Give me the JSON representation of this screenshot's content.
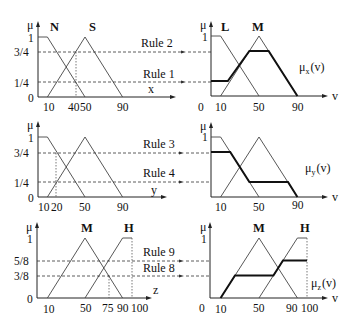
{
  "diagram": {
    "rows": [
      {
        "id": "x",
        "input": {
          "y_axis_label": "μ",
          "x_axis_label": "x",
          "y_ticks": [
            "1",
            "3/4",
            "1/4",
            "0"
          ],
          "y_tick_values": [
            1,
            0.75,
            0.25,
            0
          ],
          "x_ticks": [
            "10",
            "40",
            "50",
            "90"
          ],
          "x_tick_values": [
            10,
            40,
            50,
            90
          ],
          "sets": [
            {
              "name": "N",
              "points": [
                [
                  0,
                  1
                ],
                [
                  10,
                  1
                ],
                [
                  50,
                  0
                ]
              ]
            },
            {
              "name": "S",
              "points": [
                [
                  10,
                  0
                ],
                [
                  50,
                  1
                ],
                [
                  90,
                  0
                ]
              ]
            }
          ],
          "crisp_input": 40,
          "levels": [
            0.75,
            0.25
          ]
        },
        "rules": [
          {
            "label": "Rule 2",
            "level": 0.75
          },
          {
            "label": "Rule 1",
            "level": 0.25
          }
        ],
        "output": {
          "y_axis_label": "μ",
          "x_axis_label": "v",
          "y_ticks": [
            "1"
          ],
          "x_ticks": [
            "0",
            "10",
            "50",
            "90"
          ],
          "x_tick_values": [
            0,
            10,
            50,
            90
          ],
          "sets": [
            {
              "name": "L",
              "points": [
                [
                  0,
                  1
                ],
                [
                  10,
                  1
                ],
                [
                  50,
                  0
                ]
              ]
            },
            {
              "name": "M",
              "points": [
                [
                  10,
                  0
                ],
                [
                  50,
                  1
                ],
                [
                  90,
                  0
                ]
              ]
            }
          ],
          "aggregate_label": "μ x (v)",
          "aggregate_main": "μ",
          "aggregate_sub": "x",
          "aggregate_tail": "(v)",
          "aggregate": [
            [
              0,
              0.25
            ],
            [
              17.5,
              0.25
            ],
            [
              40,
              0.75
            ],
            [
              60,
              0.75
            ],
            [
              90,
              0
            ]
          ]
        }
      },
      {
        "id": "y",
        "input": {
          "y_axis_label": "μ",
          "x_axis_label": "y",
          "y_ticks": [
            "1",
            "3/4",
            "1/4",
            "0"
          ],
          "y_tick_values": [
            1,
            0.75,
            0.25,
            0
          ],
          "x_ticks": [
            "10",
            "20",
            "50",
            "90"
          ],
          "x_tick_values": [
            10,
            20,
            50,
            90
          ],
          "sets": [
            {
              "name": "",
              "points": [
                [
                  0,
                  1
                ],
                [
                  10,
                  1
                ],
                [
                  50,
                  0
                ]
              ]
            },
            {
              "name": "",
              "points": [
                [
                  10,
                  0
                ],
                [
                  50,
                  1
                ],
                [
                  90,
                  0
                ]
              ]
            }
          ],
          "crisp_input": 20,
          "levels": [
            0.75,
            0.25
          ]
        },
        "rules": [
          {
            "label": "Rule 3",
            "level": 0.75
          },
          {
            "label": "Rule 4",
            "level": 0.25
          }
        ],
        "output": {
          "y_axis_label": "μ",
          "x_axis_label": "v",
          "y_ticks": [
            "1"
          ],
          "x_ticks": [
            "10",
            "50",
            "90"
          ],
          "x_tick_values": [
            10,
            50,
            90
          ],
          "sets": [
            {
              "name": "",
              "points": [
                [
                  0,
                  1
                ],
                [
                  10,
                  1
                ],
                [
                  50,
                  0
                ]
              ]
            },
            {
              "name": "",
              "points": [
                [
                  10,
                  0
                ],
                [
                  50,
                  1
                ],
                [
                  90,
                  0
                ]
              ]
            }
          ],
          "aggregate_label": "μ y (v)",
          "aggregate_main": "μ",
          "aggregate_sub": "y",
          "aggregate_tail": "(v)",
          "aggregate": [
            [
              0,
              0.75
            ],
            [
              20,
              0.75
            ],
            [
              40,
              0.25
            ],
            [
              80,
              0.25
            ],
            [
              90,
              0
            ]
          ]
        }
      },
      {
        "id": "z",
        "input": {
          "y_axis_label": "μ",
          "x_axis_label": "z",
          "y_ticks": [
            "1",
            "5/8",
            "3/8",
            "0"
          ],
          "y_tick_values": [
            1,
            0.625,
            0.375,
            0
          ],
          "x_ticks": [
            "10",
            "50",
            "75",
            "90",
            "100"
          ],
          "x_tick_values": [
            10,
            50,
            75,
            90,
            100
          ],
          "sets": [
            {
              "name": "M",
              "points": [
                [
                  10,
                  0
                ],
                [
                  50,
                  1
                ],
                [
                  90,
                  0
                ]
              ]
            },
            {
              "name": "H",
              "points": [
                [
                  50,
                  0
                ],
                [
                  90,
                  1
                ],
                [
                  100,
                  1
                ]
              ]
            }
          ],
          "crisp_input": 75,
          "levels": [
            0.625,
            0.375
          ]
        },
        "rules": [
          {
            "label": "Rule 9",
            "level": 0.625
          },
          {
            "label": "Rule 8",
            "level": 0.375
          }
        ],
        "output": {
          "y_axis_label": "μ",
          "x_axis_label": "v",
          "y_ticks": [
            "1"
          ],
          "x_ticks": [
            "0",
            "10",
            "50",
            "90",
            "100"
          ],
          "x_tick_values": [
            0,
            10,
            50,
            90,
            100
          ],
          "sets": [
            {
              "name": "M",
              "points": [
                [
                  10,
                  0
                ],
                [
                  50,
                  1
                ],
                [
                  90,
                  0
                ]
              ]
            },
            {
              "name": "H",
              "points": [
                [
                  50,
                  0
                ],
                [
                  90,
                  1
                ],
                [
                  100,
                  1
                ]
              ]
            }
          ],
          "aggregate_label": "μ z (v)",
          "aggregate_main": "μ",
          "aggregate_sub": "z",
          "aggregate_tail": "(v)",
          "aggregate": [
            [
              10,
              0
            ],
            [
              25,
              0.375
            ],
            [
              65,
              0.375
            ],
            [
              75,
              0.625
            ],
            [
              100,
              0.625
            ]
          ]
        }
      }
    ]
  }
}
